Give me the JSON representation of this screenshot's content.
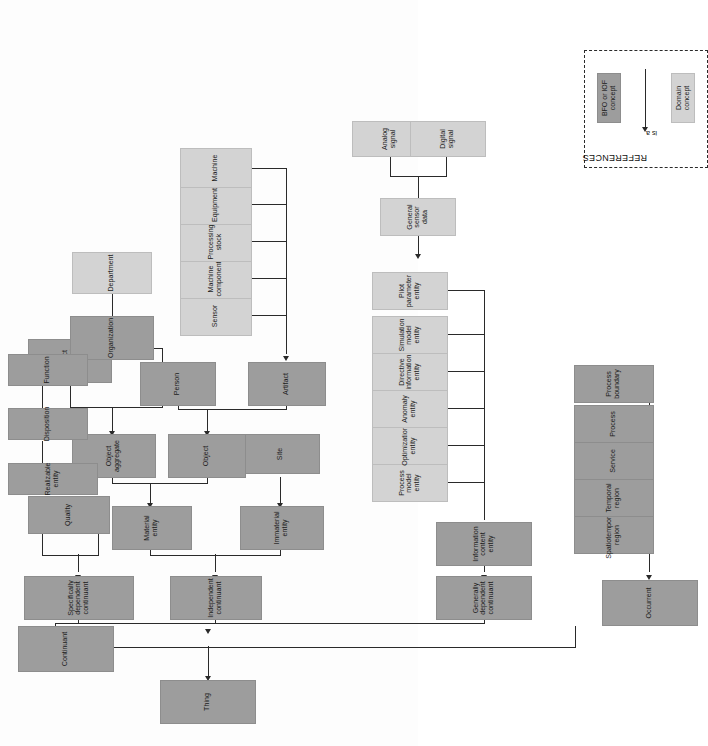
{
  "diagram": {
    "relation_label": "is a",
    "colors": {
      "bfo_concept": "#9d9d9d",
      "domain_concept": "#d3d3d3",
      "line": "#2a2a2a",
      "background": "#ffffff"
    }
  },
  "legend": {
    "title": "REFERENCES",
    "relation": "is a",
    "items": [
      {
        "label": "BFO or IOF concept",
        "type": "bfo"
      },
      {
        "label": "Domain concept",
        "type": "domain"
      }
    ]
  },
  "nodes": {
    "thing": "Thing",
    "continuant": "Continuant",
    "occurrent": "Occurrent",
    "independent_continuant": "Independent continuant",
    "specifically_dependent_continuant": "Specifically dependent continuant",
    "generally_dependent_continuant": "Generally dependent continuant",
    "material_entity": "Material entity",
    "immaterial_entity": "Immaterial entity",
    "site": "Site",
    "object": "Object",
    "object_aggregate": "Object aggregate",
    "person": "Person",
    "artifact": "Artifact",
    "artifact_aggregate": "Artifact aggregate",
    "organization": "Organization",
    "department": "Department",
    "sensor": "Sensor",
    "machine_component": "Machine component",
    "processing_stock": "Processing stock",
    "equipment": "Equipment",
    "machine": "Machine",
    "quality": "Quality",
    "realizable_entity": "Realizable entity",
    "disposition": "Disposition",
    "function": "Function",
    "information_content_entity": "Information content entity",
    "process_model_entity": "Process model entity",
    "optimization_entity": "Optimization entity",
    "anomaly_entity": "Anomaly entity",
    "directive_information_entity": "Directive information entity",
    "simulation_model_entity": "Simulation model entity",
    "pilot_parameter_entity": "Pilot parameter entity",
    "general_sensor_data": "General sensor data",
    "analog_signal": "Analog signal",
    "digital_signal": "Digital signal",
    "spatiotemporal_region": "Spatiotemporal region",
    "temporal_region": "Temporal region",
    "service": "Service",
    "process": "Process",
    "process_boundary": "Process boundary"
  }
}
